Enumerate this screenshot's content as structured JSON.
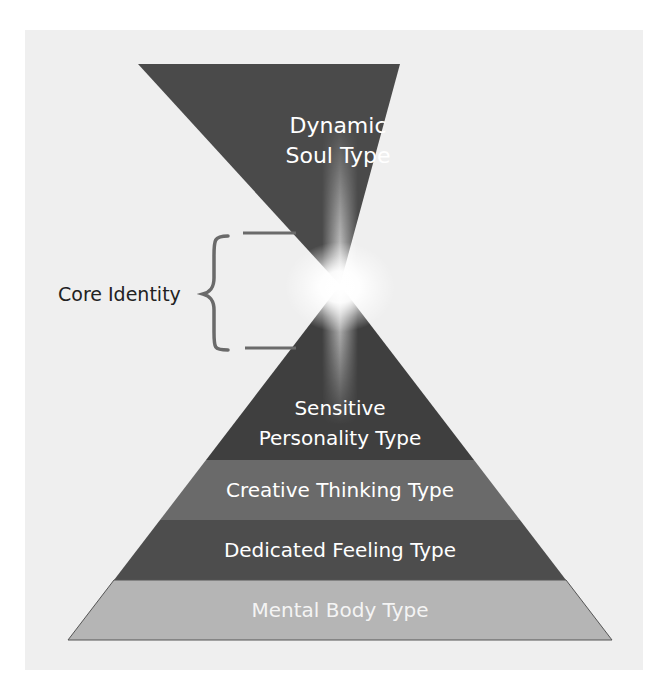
{
  "diagram": {
    "top_triangle": {
      "label_line1": "Dynamic",
      "label_line2": "Soul Type",
      "color": "#4a4a4a"
    },
    "core_identity": {
      "label": "Core Identity",
      "bracket_color": "#666666"
    },
    "pyramid_layers": [
      {
        "line1": "Sensitive",
        "line2": "Personality Type",
        "color": "#3f3f3f"
      },
      {
        "line1": "Creative Thinking Type",
        "color": "#6a6a6a"
      },
      {
        "line1": "Dedicated Feeling Type",
        "color": "#4d4d4d"
      },
      {
        "line1": "Mental Body Type",
        "color": "#b5b5b5"
      }
    ],
    "background_color": "#f0f0f0",
    "text_color_on_dark": "#ffffff",
    "label_color": "#222222"
  }
}
